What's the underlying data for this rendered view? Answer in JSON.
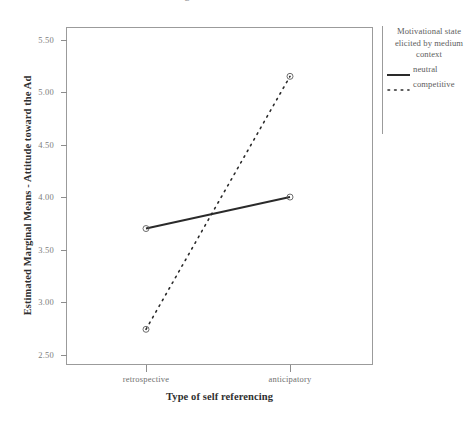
{
  "chart": {
    "title": "Estimated Marginal Means of Attitude toward the Ad",
    "xlabel": "Type of self referencing",
    "ylabel": "Estimated Marginal Means - Attitude toward the Ad"
  },
  "legend": {
    "title": "Motivational state elicited by medium context",
    "entries": [
      {
        "label": "neutral",
        "style": "solid"
      },
      {
        "label": "competitive",
        "style": "dotted"
      }
    ]
  },
  "chart_data": {
    "type": "line",
    "title": "Estimated Marginal Means of Attitude toward the Ad",
    "xlabel": "Type of self referencing",
    "ylabel": "Estimated Marginal Means - Attitude toward the Ad",
    "categories": [
      "retrospective",
      "anticipatory"
    ],
    "series": [
      {
        "name": "neutral",
        "values": [
          3.7,
          4.0
        ],
        "style": "solid"
      },
      {
        "name": "competitive",
        "values": [
          2.74,
          5.15
        ],
        "style": "dotted"
      }
    ],
    "ylim": [
      2.4,
      5.62
    ],
    "yticks": [
      2.5,
      3.0,
      3.5,
      4.0,
      4.5,
      5.0,
      5.5
    ],
    "ytick_labels": [
      "2.50",
      "3.00",
      "3.50",
      "4.00",
      "4.50",
      "5.00",
      "5.50"
    ],
    "grid": false,
    "legend_position": "right",
    "markers": true
  }
}
